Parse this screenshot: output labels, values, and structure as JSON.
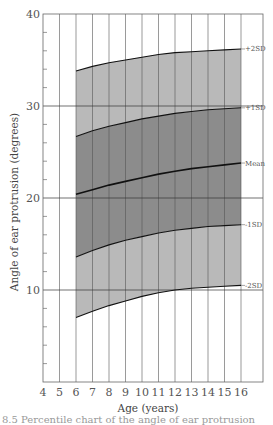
{
  "chart_data": {
    "type": "area",
    "title": "",
    "xlabel": "Age (years)",
    "ylabel": "Angle of ear protrusion (degrees)",
    "xlim": [
      4,
      17.3
    ],
    "ylim": [
      0,
      40
    ],
    "x_ticks": [
      4,
      5,
      6,
      7,
      8,
      9,
      10,
      11,
      12,
      13,
      14,
      15,
      16
    ],
    "y_ticks": [
      10,
      20,
      30,
      40
    ],
    "grid": {
      "vertical_every_year": true,
      "horizontal_at": [
        10,
        20,
        30
      ]
    },
    "x": [
      6,
      7,
      8,
      9,
      10,
      11,
      12,
      13,
      14,
      15,
      16
    ],
    "series": [
      {
        "name": "+2SD",
        "values": [
          33.8,
          34.3,
          34.7,
          35.0,
          35.3,
          35.6,
          35.8,
          35.9,
          36.0,
          36.1,
          36.2
        ]
      },
      {
        "name": "+1SD",
        "values": [
          26.7,
          27.3,
          27.8,
          28.2,
          28.6,
          28.9,
          29.2,
          29.4,
          29.6,
          29.7,
          29.8
        ]
      },
      {
        "name": "Mean",
        "values": [
          20.4,
          20.9,
          21.4,
          21.8,
          22.2,
          22.6,
          22.9,
          23.2,
          23.4,
          23.6,
          23.8
        ]
      },
      {
        "name": "-1SD",
        "values": [
          13.6,
          14.3,
          14.9,
          15.4,
          15.8,
          16.2,
          16.5,
          16.7,
          16.9,
          17.0,
          17.1
        ]
      },
      {
        "name": "-2SD",
        "values": [
          7.0,
          7.7,
          8.3,
          8.8,
          9.3,
          9.7,
          10.0,
          10.2,
          10.3,
          10.4,
          10.5
        ]
      }
    ],
    "bands": [
      {
        "between": [
          "+1SD",
          "+2SD"
        ],
        "color": "#b9b9b9"
      },
      {
        "between": [
          "-1SD",
          "+1SD"
        ],
        "color": "#8c8c8c"
      },
      {
        "between": [
          "-2SD",
          "-1SD"
        ],
        "color": "#b9b9b9"
      }
    ],
    "line_labels": [
      "+2SD",
      "+1SD",
      "Mean",
      "-1SD",
      "-2SD"
    ]
  },
  "caption": "8.5 Percentile chart of the angle of ear protrusion"
}
